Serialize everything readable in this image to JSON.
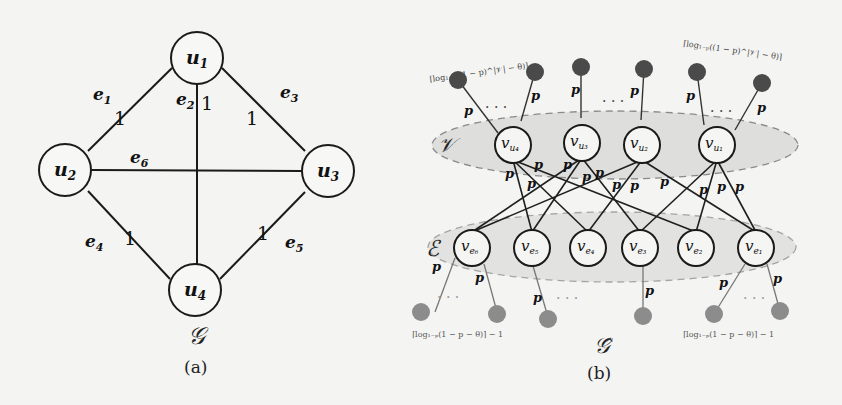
{
  "figure_a": {
    "caption": "(a)",
    "graph_symbol": "𝒢",
    "vertices": [
      {
        "id": "u1",
        "label": "u",
        "sub": "1",
        "x": 197,
        "y": 58
      },
      {
        "id": "u2",
        "label": "u",
        "sub": "2",
        "x": 65,
        "y": 170
      },
      {
        "id": "u3",
        "label": "u",
        "sub": "3",
        "x": 328,
        "y": 171
      },
      {
        "id": "u4",
        "label": "u",
        "sub": "4",
        "x": 195,
        "y": 290
      }
    ],
    "edges": [
      {
        "id": "e1",
        "from": "u1",
        "to": "u2",
        "label": "e",
        "sub": "1",
        "weight": "1"
      },
      {
        "id": "e2",
        "from": "u1",
        "to": "u4",
        "label": "e",
        "sub": "2",
        "weight": "1"
      },
      {
        "id": "e3",
        "from": "u1",
        "to": "u3",
        "label": "e",
        "sub": "3",
        "weight": "1"
      },
      {
        "id": "e4",
        "from": "u2",
        "to": "u4",
        "label": "e",
        "sub": "4",
        "weight": "1"
      },
      {
        "id": "e5",
        "from": "u3",
        "to": "u4",
        "label": "e",
        "sub": "5",
        "weight": "1"
      },
      {
        "id": "e6",
        "from": "u2",
        "to": "u3",
        "label": "e",
        "sub": "6",
        "weight": ""
      }
    ]
  },
  "figure_b": {
    "caption": "(b)",
    "graph_symbol": "𝒢̂",
    "vertex_set_label": "𝒱",
    "edge_set_label": "ℰ",
    "edge_prob_label": "p",
    "vertex_nodes": [
      {
        "id": "v_u4",
        "label": "v",
        "sub": "u₄"
      },
      {
        "id": "v_u3",
        "label": "v",
        "sub": "u₃"
      },
      {
        "id": "v_u2",
        "label": "v",
        "sub": "u₂"
      },
      {
        "id": "v_u1",
        "label": "v",
        "sub": "u₁"
      }
    ],
    "edge_nodes": [
      {
        "id": "v_e6",
        "label": "v",
        "sub": "e₆"
      },
      {
        "id": "v_e5",
        "label": "v",
        "sub": "e₅"
      },
      {
        "id": "v_e4",
        "label": "v",
        "sub": "e₄"
      },
      {
        "id": "v_e3",
        "label": "v",
        "sub": "e₃"
      },
      {
        "id": "v_e2",
        "label": "v",
        "sub": "e₂"
      },
      {
        "id": "v_e1",
        "label": "v",
        "sub": "e₁"
      }
    ],
    "top_annotation_left": "⌈log₁₋ₚ((1 − p)^|𝒱| − θ)⌉",
    "top_annotation_right": "⌈log₁₋ₚ((1 − p)^|𝒱| − θ)⌉",
    "bottom_annotation_left": "⌈log₁₋ₚ(1 − p − θ)⌉ − 1",
    "bottom_annotation_right": "⌈log₁₋ₚ(1 − p − θ)⌉ − 1",
    "ellipsis": ". . ."
  },
  "colors": {
    "background": "#f4f4f2",
    "stroke": "#1a1a1a",
    "set_fill": "#dededc",
    "top_leaf": "#4a4a4a",
    "bottom_leaf": "#8c8c8c"
  }
}
